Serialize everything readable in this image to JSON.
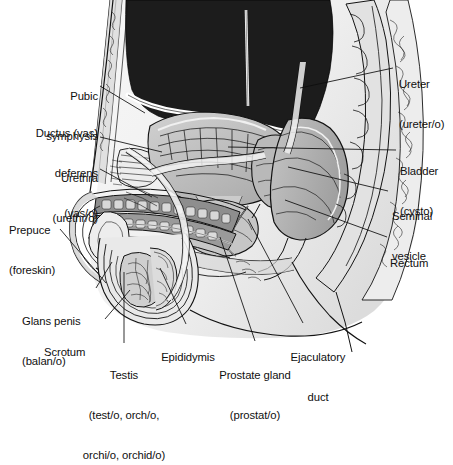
{
  "figure": {
    "background_color": "#ffffff",
    "line_color": "#111111",
    "palette": {
      "cavity_dark": "#1c1c1c",
      "tissue_light": "#e6e6e6",
      "tissue_mid": "#c9c9c9",
      "tissue_dark": "#a8a8a8",
      "organ_gray": "#b5b5b5",
      "highlight_white": "#fafafa",
      "body_outline_fill": "#f2f2f2"
    }
  },
  "labels": [
    {
      "id": "pubic-symphysis",
      "term": "Pubic",
      "term2": "symphysis",
      "combining_form": "",
      "align": "right",
      "x": 16,
      "y": 66,
      "width": 82,
      "leader": {
        "x1": 100,
        "y1": 86,
        "x2": 145,
        "y2": 113
      }
    },
    {
      "id": "ductus-vas-deferens",
      "term": "Ductus (vas)",
      "term2": "deferens",
      "combining_form": "(vas/o)",
      "align": "right",
      "x": 10,
      "y": 101,
      "width": 88,
      "leader": {
        "x1": 100,
        "y1": 137,
        "x2": 160,
        "y2": 152
      }
    },
    {
      "id": "urethra",
      "term": "Urethra",
      "term2": "",
      "combining_form": "(urethr/o)",
      "align": "right",
      "x": 14,
      "y": 146,
      "width": 84,
      "leader": {
        "x1": 100,
        "y1": 169,
        "x2": 152,
        "y2": 196
      }
    },
    {
      "id": "prepuce",
      "term": "Prepuce",
      "term2": "",
      "combining_form": "(foreskin)",
      "align": "left",
      "x": 9,
      "y": 198,
      "width": 76,
      "leader": {
        "x1": 60,
        "y1": 228,
        "x2": 106,
        "y2": 283
      }
    },
    {
      "id": "glans-penis",
      "term": "Glans penis",
      "term2": "",
      "combining_form": "(balan/o)",
      "align": "left",
      "x": 22,
      "y": 290,
      "width": 80,
      "leader": {
        "x1": 96,
        "y1": 288,
        "x2": 112,
        "y2": 262
      }
    },
    {
      "id": "scrotum",
      "term": "Scrotum",
      "term2": "",
      "combining_form": "",
      "align": "left",
      "x": 44,
      "y": 320,
      "width": 58,
      "leader": {
        "x1": 105,
        "y1": 319,
        "x2": 130,
        "y2": 290
      }
    },
    {
      "id": "testis",
      "term": "Testis",
      "term2": "",
      "combining_form": "(test/o, orch/o,",
      "combining_form2": "orchi/o, orchid/o)",
      "align": "center",
      "x": 64,
      "y": 344,
      "width": 120,
      "leader": {
        "x1": 124,
        "y1": 343,
        "x2": 124,
        "y2": 272
      }
    },
    {
      "id": "epididymis",
      "term": "Epididymis",
      "term2": "",
      "combining_form": "",
      "align": "center",
      "x": 148,
      "y": 326,
      "width": 76,
      "leader": {
        "x1": 186,
        "y1": 324,
        "x2": 160,
        "y2": 268
      }
    },
    {
      "id": "prostate-gland",
      "term": "Prostate gland",
      "term2": "",
      "combining_form": "(prostat/o)",
      "align": "center",
      "x": 205,
      "y": 344,
      "width": 100,
      "leader": {
        "x1": 255,
        "y1": 341,
        "x2": 220,
        "y2": 237
      }
    },
    {
      "id": "ejaculatory-duct",
      "term": "Ejaculatory",
      "term2": "duct",
      "combining_form": "",
      "align": "center",
      "x": 277,
      "y": 326,
      "width": 80,
      "leader": {
        "x1": 303,
        "y1": 323,
        "x2": 248,
        "y2": 219
      }
    },
    {
      "id": "ureter",
      "term": "Ureter",
      "term2": "",
      "combining_form": "(ureter/o)",
      "align": "left",
      "x": 396,
      "y": 53,
      "width": 60,
      "leader": {
        "x1": 393,
        "y1": 68,
        "x2": 300,
        "y2": 88
      }
    },
    {
      "id": "bladder",
      "term": "Bladder",
      "term2": "",
      "combining_form": "(cysto)",
      "align": "left",
      "x": 400,
      "y": 140,
      "width": 56,
      "leader": {
        "x1": 396,
        "y1": 150,
        "x2": 228,
        "y2": 147
      }
    },
    {
      "id": "seminal-vesicle",
      "term": "Seminal",
      "term2": "vesicle",
      "combining_form": "",
      "align": "left",
      "x": 392,
      "y": 185,
      "width": 60,
      "leader": {
        "x1": 388,
        "y1": 191,
        "x2": 288,
        "y2": 167
      }
    },
    {
      "id": "rectum",
      "term": "Rectum",
      "term2": "",
      "combining_form": "",
      "align": "left",
      "x": 390,
      "y": 232,
      "width": 56,
      "leader": {
        "x1": 387,
        "y1": 237,
        "x2": 285,
        "y2": 200
      }
    }
  ]
}
